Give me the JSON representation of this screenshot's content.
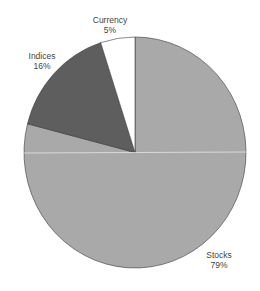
{
  "chart_data": {
    "type": "pie",
    "title": "",
    "categories": [
      "Stocks",
      "Indices",
      "Currency"
    ],
    "values": [
      79,
      16,
      5
    ],
    "unit": "%",
    "colors": [
      "#a9a9a9",
      "#5e5e5e",
      "#ffffff"
    ],
    "start_angle": "12 o'clock, clockwise",
    "legend": "none (direct labels)"
  },
  "labels": {
    "currency": {
      "name": "Currency",
      "value": "5%"
    },
    "indices": {
      "name": "Indices",
      "value": "16%"
    },
    "stocks": {
      "name": "Stocks",
      "value": "79%"
    }
  }
}
